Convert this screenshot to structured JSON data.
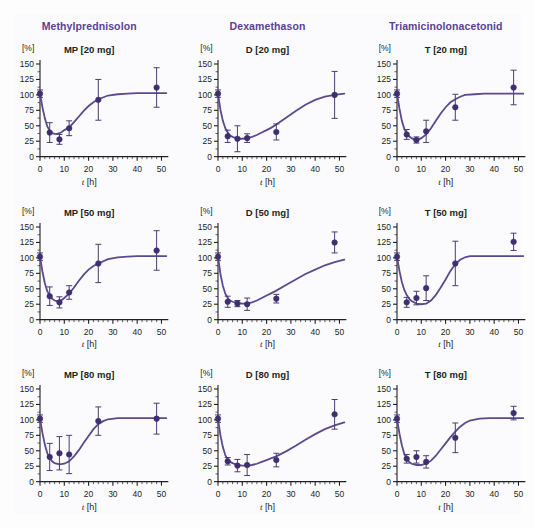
{
  "figure": {
    "background_color": "#fdfdfe",
    "accent_color": "#5b3f96",
    "marker_color": "#3f2f6e",
    "curve_color": "#5b4a8e"
  },
  "columns": [
    {
      "label": "Methylprednisolon"
    },
    {
      "label": "Dexamethason"
    },
    {
      "label": "Triamicinolonacetonid"
    }
  ],
  "axes": {
    "ylabel": "[%]",
    "xlabel_symbol": "t",
    "xlabel_unit": "[h]",
    "yticks": [
      0,
      25,
      50,
      75,
      100,
      125,
      150
    ],
    "xticks": [
      0,
      10,
      20,
      30,
      40,
      50
    ],
    "ylim": [
      0,
      150
    ],
    "xlim": [
      0,
      52
    ],
    "x_minor_step": 2,
    "y_minor_step": 12.5
  },
  "chart_data": [
    {
      "type": "scatter",
      "title": "MP [20 mg]",
      "drug": "Methylprednisolon",
      "dose": "20 mg",
      "xlabel": "t [h]",
      "ylabel": "[%]",
      "xlim": [
        0,
        52
      ],
      "ylim": [
        0,
        150
      ],
      "grid": false,
      "x": [
        0,
        4,
        8,
        12,
        24,
        48
      ],
      "values": [
        102,
        39,
        28,
        46,
        92,
        112
      ],
      "errors": [
        6,
        16,
        8,
        12,
        33,
        32
      ],
      "fit_curve": [
        [
          0,
          102
        ],
        [
          1,
          80
        ],
        [
          2,
          62
        ],
        [
          3,
          49
        ],
        [
          4,
          42
        ],
        [
          5,
          38
        ],
        [
          6,
          37
        ],
        [
          7,
          37
        ],
        [
          8,
          38
        ],
        [
          9,
          40
        ],
        [
          10,
          43
        ],
        [
          12,
          47
        ],
        [
          14,
          56
        ],
        [
          16,
          65
        ],
        [
          18,
          74
        ],
        [
          20,
          82
        ],
        [
          22,
          88
        ],
        [
          24,
          93
        ],
        [
          28,
          99
        ],
        [
          32,
          101
        ],
        [
          36,
          102
        ],
        [
          40,
          103
        ],
        [
          44,
          103
        ],
        [
          48,
          103
        ],
        [
          52,
          103
        ]
      ]
    },
    {
      "type": "scatter",
      "title": "D [20 mg]",
      "drug": "Dexamethason",
      "dose": "20 mg",
      "xlabel": "t [h]",
      "ylabel": "[%]",
      "xlim": [
        0,
        52
      ],
      "ylim": [
        0,
        150
      ],
      "grid": false,
      "x": [
        0,
        4,
        8,
        12,
        24,
        48
      ],
      "values": [
        102,
        33,
        29,
        30,
        40,
        100
      ],
      "errors": [
        6,
        10,
        21,
        7,
        13,
        38
      ],
      "fit_curve": [
        [
          0,
          102
        ],
        [
          1,
          76
        ],
        [
          2,
          58
        ],
        [
          3,
          46
        ],
        [
          4,
          39
        ],
        [
          5,
          34
        ],
        [
          6,
          32
        ],
        [
          8,
          29
        ],
        [
          10,
          29
        ],
        [
          12,
          30
        ],
        [
          14,
          32
        ],
        [
          16,
          35
        ],
        [
          18,
          39
        ],
        [
          20,
          43
        ],
        [
          22,
          47
        ],
        [
          24,
          52
        ],
        [
          28,
          63
        ],
        [
          32,
          74
        ],
        [
          36,
          84
        ],
        [
          40,
          92
        ],
        [
          44,
          97
        ],
        [
          48,
          100
        ],
        [
          52,
          102
        ]
      ]
    },
    {
      "type": "scatter",
      "title": "T [20 mg]",
      "drug": "Triamicinolonacetonid",
      "dose": "20 mg",
      "xlabel": "t [h]",
      "ylabel": "[%]",
      "xlim": [
        0,
        52
      ],
      "ylim": [
        0,
        150
      ],
      "grid": false,
      "x": [
        0,
        4,
        8,
        12,
        24,
        48
      ],
      "values": [
        102,
        36,
        27,
        41,
        80,
        112
      ],
      "errors": [
        6,
        8,
        5,
        18,
        21,
        28
      ],
      "fit_curve": [
        [
          0,
          102
        ],
        [
          1,
          78
        ],
        [
          2,
          58
        ],
        [
          3,
          45
        ],
        [
          4,
          38
        ],
        [
          5,
          33
        ],
        [
          6,
          30
        ],
        [
          7,
          28
        ],
        [
          8,
          27
        ],
        [
          9,
          28
        ],
        [
          10,
          30
        ],
        [
          12,
          36
        ],
        [
          14,
          46
        ],
        [
          16,
          58
        ],
        [
          18,
          70
        ],
        [
          20,
          80
        ],
        [
          22,
          88
        ],
        [
          24,
          93
        ],
        [
          26,
          97
        ],
        [
          28,
          100
        ],
        [
          32,
          101
        ],
        [
          36,
          102
        ],
        [
          40,
          102
        ],
        [
          44,
          102
        ],
        [
          48,
          102
        ],
        [
          52,
          102
        ]
      ]
    },
    {
      "type": "scatter",
      "title": "MP [50 mg]",
      "drug": "Methylprednisolon",
      "dose": "50 mg",
      "xlabel": "t [h]",
      "ylabel": "[%]",
      "xlim": [
        0,
        52
      ],
      "ylim": [
        0,
        150
      ],
      "grid": false,
      "x": [
        0,
        4,
        8,
        12,
        24,
        48
      ],
      "values": [
        102,
        38,
        28,
        44,
        91,
        112
      ],
      "errors": [
        6,
        15,
        9,
        11,
        31,
        32
      ],
      "fit_curve": [
        [
          0,
          102
        ],
        [
          1,
          78
        ],
        [
          2,
          59
        ],
        [
          3,
          46
        ],
        [
          4,
          39
        ],
        [
          5,
          34
        ],
        [
          6,
          31
        ],
        [
          7,
          30
        ],
        [
          8,
          30
        ],
        [
          9,
          32
        ],
        [
          10,
          35
        ],
        [
          12,
          42
        ],
        [
          14,
          52
        ],
        [
          16,
          63
        ],
        [
          18,
          73
        ],
        [
          20,
          81
        ],
        [
          22,
          87
        ],
        [
          24,
          91
        ],
        [
          28,
          98
        ],
        [
          32,
          101
        ],
        [
          36,
          102
        ],
        [
          40,
          103
        ],
        [
          44,
          103
        ],
        [
          48,
          103
        ],
        [
          52,
          103
        ]
      ]
    },
    {
      "type": "scatter",
      "title": "D [50 mg]",
      "drug": "Dexamethason",
      "dose": "50 mg",
      "xlabel": "t [h]",
      "ylabel": "[%]",
      "xlim": [
        0,
        52
      ],
      "ylim": [
        0,
        150
      ],
      "grid": false,
      "x": [
        0,
        4,
        8,
        12,
        24,
        48
      ],
      "values": [
        102,
        29,
        26,
        25,
        34,
        125
      ],
      "errors": [
        6,
        9,
        5,
        10,
        7,
        17
      ],
      "fit_curve": [
        [
          0,
          102
        ],
        [
          1,
          74
        ],
        [
          2,
          55
        ],
        [
          3,
          42
        ],
        [
          4,
          35
        ],
        [
          5,
          31
        ],
        [
          6,
          29
        ],
        [
          8,
          27
        ],
        [
          10,
          26
        ],
        [
          12,
          26
        ],
        [
          14,
          28
        ],
        [
          16,
          31
        ],
        [
          18,
          35
        ],
        [
          20,
          39
        ],
        [
          22,
          43
        ],
        [
          24,
          47
        ],
        [
          28,
          56
        ],
        [
          32,
          65
        ],
        [
          36,
          74
        ],
        [
          40,
          81
        ],
        [
          44,
          88
        ],
        [
          48,
          93
        ],
        [
          52,
          97
        ]
      ]
    },
    {
      "type": "scatter",
      "title": "T [50 mg]",
      "drug": "Triamicinolonacetonid",
      "dose": "50 mg",
      "xlabel": "t [h]",
      "ylabel": "[%]",
      "xlim": [
        0,
        52
      ],
      "ylim": [
        0,
        150
      ],
      "grid": false,
      "x": [
        0,
        4,
        8,
        12,
        24,
        48
      ],
      "values": [
        102,
        28,
        35,
        51,
        91,
        126
      ],
      "errors": [
        6,
        8,
        11,
        20,
        36,
        14
      ],
      "fit_curve": [
        [
          0,
          102
        ],
        [
          1,
          79
        ],
        [
          2,
          61
        ],
        [
          3,
          48
        ],
        [
          4,
          40
        ],
        [
          5,
          34
        ],
        [
          6,
          30
        ],
        [
          8,
          26
        ],
        [
          10,
          25
        ],
        [
          12,
          26
        ],
        [
          14,
          31
        ],
        [
          16,
          40
        ],
        [
          18,
          52
        ],
        [
          20,
          65
        ],
        [
          22,
          79
        ],
        [
          24,
          90
        ],
        [
          26,
          97
        ],
        [
          28,
          101
        ],
        [
          30,
          103
        ],
        [
          34,
          103
        ],
        [
          38,
          103
        ],
        [
          42,
          103
        ],
        [
          46,
          103
        ],
        [
          52,
          103
        ]
      ]
    },
    {
      "type": "scatter",
      "title": "MP [80 mg]",
      "drug": "Methylprednisolon",
      "dose": "80 mg",
      "xlabel": "t [h]",
      "ylabel": "[%]",
      "xlim": [
        0,
        52
      ],
      "ylim": [
        0,
        150
      ],
      "grid": false,
      "x": [
        0,
        4,
        8,
        12,
        24,
        48
      ],
      "values": [
        102,
        40,
        46,
        44,
        98,
        102
      ],
      "errors": [
        6,
        22,
        27,
        31,
        23,
        25
      ],
      "fit_curve": [
        [
          0,
          102
        ],
        [
          1,
          79
        ],
        [
          2,
          60
        ],
        [
          3,
          46
        ],
        [
          4,
          38
        ],
        [
          5,
          33
        ],
        [
          6,
          30
        ],
        [
          8,
          28
        ],
        [
          10,
          29
        ],
        [
          12,
          33
        ],
        [
          14,
          41
        ],
        [
          16,
          51
        ],
        [
          18,
          63
        ],
        [
          20,
          74
        ],
        [
          22,
          85
        ],
        [
          24,
          93
        ],
        [
          26,
          98
        ],
        [
          28,
          101
        ],
        [
          32,
          103
        ],
        [
          36,
          103
        ],
        [
          40,
          103
        ],
        [
          44,
          103
        ],
        [
          48,
          103
        ],
        [
          52,
          103
        ]
      ]
    },
    {
      "type": "scatter",
      "title": "D [80 mg]",
      "drug": "Dexamethason",
      "dose": "80 mg",
      "xlabel": "t [h]",
      "ylabel": "[%]",
      "xlim": [
        0,
        52
      ],
      "ylim": [
        0,
        150
      ],
      "grid": false,
      "x": [
        0,
        4,
        8,
        12,
        24,
        48
      ],
      "values": [
        102,
        33,
        26,
        27,
        35,
        109
      ],
      "errors": [
        6,
        6,
        10,
        17,
        11,
        24
      ],
      "fit_curve": [
        [
          0,
          102
        ],
        [
          1,
          75
        ],
        [
          2,
          56
        ],
        [
          3,
          43
        ],
        [
          4,
          36
        ],
        [
          5,
          32
        ],
        [
          6,
          30
        ],
        [
          8,
          27
        ],
        [
          10,
          26
        ],
        [
          12,
          26
        ],
        [
          14,
          27
        ],
        [
          16,
          29
        ],
        [
          18,
          32
        ],
        [
          20,
          35
        ],
        [
          22,
          38
        ],
        [
          24,
          41
        ],
        [
          28,
          49
        ],
        [
          32,
          58
        ],
        [
          36,
          68
        ],
        [
          40,
          77
        ],
        [
          44,
          85
        ],
        [
          48,
          91
        ],
        [
          52,
          96
        ]
      ]
    },
    {
      "type": "scatter",
      "title": "T [80 mg]",
      "drug": "Triamicinolonacetonid",
      "dose": "80 mg",
      "xlabel": "t [h]",
      "ylabel": "[%]",
      "xlim": [
        0,
        52
      ],
      "ylim": [
        0,
        150
      ],
      "grid": false,
      "x": [
        0,
        4,
        8,
        12,
        24,
        48
      ],
      "values": [
        102,
        37,
        40,
        32,
        71,
        111
      ],
      "errors": [
        6,
        7,
        10,
        10,
        24,
        11
      ],
      "fit_curve": [
        [
          0,
          102
        ],
        [
          1,
          78
        ],
        [
          2,
          59
        ],
        [
          3,
          45
        ],
        [
          4,
          37
        ],
        [
          5,
          32
        ],
        [
          6,
          29
        ],
        [
          8,
          27
        ],
        [
          10,
          27
        ],
        [
          12,
          29
        ],
        [
          14,
          34
        ],
        [
          16,
          42
        ],
        [
          18,
          52
        ],
        [
          20,
          62
        ],
        [
          22,
          72
        ],
        [
          24,
          81
        ],
        [
          26,
          89
        ],
        [
          28,
          95
        ],
        [
          30,
          99
        ],
        [
          34,
          102
        ],
        [
          38,
          103
        ],
        [
          42,
          103
        ],
        [
          46,
          103
        ],
        [
          52,
          103
        ]
      ]
    }
  ]
}
